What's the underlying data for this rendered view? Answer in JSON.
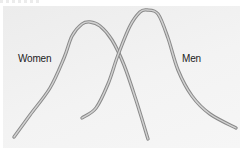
{
  "chart_data": {
    "type": "line",
    "title": "",
    "xlabel": "",
    "ylabel": "",
    "grid": false,
    "axes": false,
    "legend": "inline labels",
    "series": [
      {
        "name": "Women",
        "description": "Distribution curve peaking to the left",
        "peak": {
          "x": 90,
          "y": 22
        },
        "points": [
          [
            14,
            137
          ],
          [
            30,
            115
          ],
          [
            50,
            88
          ],
          [
            64,
            58
          ],
          [
            72,
            36
          ],
          [
            82,
            24
          ],
          [
            90,
            22
          ],
          [
            100,
            26
          ],
          [
            112,
            40
          ],
          [
            124,
            65
          ],
          [
            136,
            100
          ],
          [
            148,
            139
          ]
        ]
      },
      {
        "name": "Men",
        "description": "Distribution curve peaking to the right, longer right tail",
        "peak": {
          "x": 147,
          "y": 10
        },
        "points": [
          [
            82,
            118
          ],
          [
            96,
            108
          ],
          [
            108,
            84
          ],
          [
            118,
            55
          ],
          [
            130,
            26
          ],
          [
            140,
            12
          ],
          [
            147,
            10
          ],
          [
            158,
            14
          ],
          [
            168,
            38
          ],
          [
            178,
            70
          ],
          [
            192,
            96
          ],
          [
            210,
            114
          ],
          [
            236,
            128
          ]
        ]
      }
    ],
    "colors": {
      "curve_outline": "#8a8a8a",
      "curve_inner": "#cfcfcf",
      "panel_background": "#efefef",
      "label_text": "#222222"
    }
  },
  "labels": {
    "women": "Women",
    "men": "Men"
  }
}
